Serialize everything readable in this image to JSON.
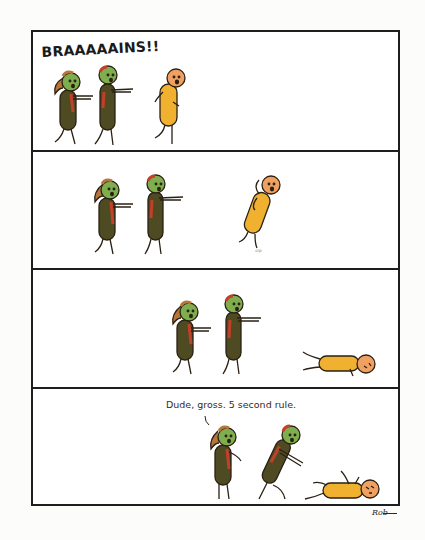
{
  "comic": {
    "panel_count": 4,
    "panels": [
      {
        "index": 1,
        "shout_text": "BRAAAAAINS!!",
        "scene": "Two green zombies shamble with arms out toward a scared orange stick figure."
      },
      {
        "index": 2,
        "sfx_text": "slip",
        "scene": "Zombies keep approaching while the orange figure slips and falls backward."
      },
      {
        "index": 3,
        "scene": "The orange figure lies flat on the ground as zombies approach."
      },
      {
        "index": 4,
        "speech_text": "Dude, gross. 5 second rule.",
        "scene": "The ponytailed zombie comments while the other zombie bends over the fallen orange figure."
      }
    ],
    "signature": "Rob"
  },
  "colors": {
    "zombie_skin": "#7fae4e",
    "zombie_body": "#4e4a22",
    "zombie_blood": "#c0402a",
    "hair": "#b4763a",
    "human_body": "#f0b030",
    "human_head": "#f0a060",
    "outline": "#2a2014",
    "border": "#1e1e1c"
  }
}
